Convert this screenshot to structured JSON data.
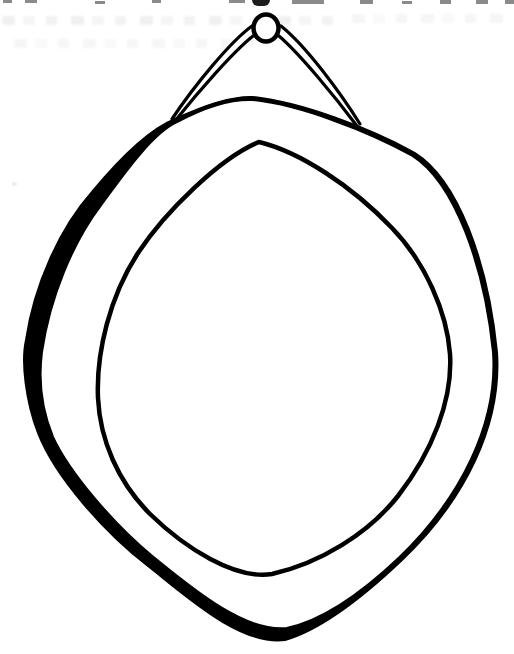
{
  "artwork": {
    "title": "Hanging oval mirror — black-and-white line drawing",
    "alt": "Ink line drawing of a wide oval frame with a blank mirror face, suspended from a round nail head by a doubled hanging cord forming a triangle; a thick black shadow runs along the lower-left rim.",
    "colors": {
      "ink": "#000000",
      "paper": "#ffffff",
      "bleed_through": "#8a8a8a"
    },
    "parts": {
      "nail": "round nail head",
      "cord": "doubled hanging cord",
      "frame": "wide oval frame band",
      "shadow": "thick ink shadow on lower-left rim",
      "mirror_face": "blank oval mirror face"
    },
    "artifacts": {
      "top_edge_marks": "cropped remnants of an illegible printed line along the top edge",
      "bleed_rows": "faint illegible text bleeding through from the reverse side"
    }
  }
}
